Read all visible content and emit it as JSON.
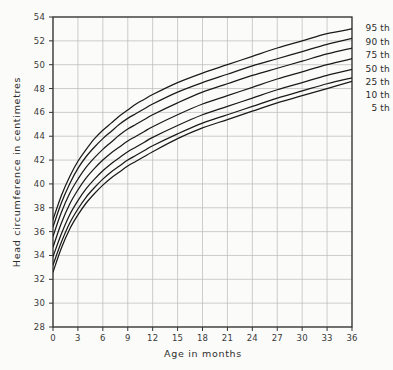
{
  "chart_data": {
    "type": "line",
    "title": "",
    "xlabel": "Age in months",
    "ylabel": "Head circumference in centimetres",
    "xlim": [
      0,
      36
    ],
    "ylim": [
      28,
      54
    ],
    "xticks": [
      0,
      3,
      6,
      9,
      12,
      15,
      18,
      21,
      24,
      27,
      30,
      33,
      36
    ],
    "yticks": [
      28,
      30,
      32,
      34,
      36,
      38,
      40,
      42,
      44,
      46,
      48,
      50,
      52,
      54
    ],
    "xtick_labels": [
      "0",
      "3",
      "6",
      "9",
      "12",
      "15",
      "18",
      "21",
      "24",
      "27",
      "30",
      "33",
      "36"
    ],
    "ytick_labels": [
      "28",
      "30",
      "32",
      "34",
      "36",
      "38",
      "40",
      "42",
      "44",
      "46",
      "48",
      "50",
      "52",
      "54"
    ],
    "grid": true,
    "legend_position": "right-inline",
    "x": [
      0,
      1,
      2,
      3,
      4,
      5,
      6,
      7,
      8,
      9,
      10,
      11,
      12,
      15,
      18,
      21,
      24,
      27,
      30,
      33,
      36
    ],
    "series": [
      {
        "name": "95 th",
        "label": "95 th",
        "color": "#1a1a1a",
        "values": [
          37.0,
          39.0,
          40.6,
          41.9,
          42.9,
          43.8,
          44.5,
          45.1,
          45.7,
          46.2,
          46.7,
          47.1,
          47.5,
          48.5,
          49.3,
          50.0,
          50.7,
          51.4,
          52.0,
          52.6,
          53.0
        ]
      },
      {
        "name": "90 th",
        "label": "90 th",
        "color": "#1a1a1a",
        "values": [
          36.4,
          38.4,
          40.0,
          41.3,
          42.3,
          43.1,
          43.8,
          44.4,
          45.0,
          45.5,
          45.9,
          46.3,
          46.7,
          47.7,
          48.5,
          49.2,
          49.9,
          50.5,
          51.1,
          51.7,
          52.2
        ]
      },
      {
        "name": "75 th",
        "label": "75 th",
        "color": "#1a1a1a",
        "values": [
          35.6,
          37.6,
          39.2,
          40.4,
          41.4,
          42.2,
          42.9,
          43.5,
          44.1,
          44.6,
          45.0,
          45.4,
          45.8,
          46.8,
          47.7,
          48.4,
          49.1,
          49.7,
          50.3,
          50.9,
          51.4
        ]
      },
      {
        "name": "50 th",
        "label": "50 th",
        "color": "#1a1a1a",
        "values": [
          34.7,
          36.7,
          38.3,
          39.5,
          40.5,
          41.3,
          42.0,
          42.6,
          43.1,
          43.6,
          44.0,
          44.4,
          44.8,
          45.8,
          46.7,
          47.4,
          48.1,
          48.8,
          49.4,
          50.0,
          50.5
        ]
      },
      {
        "name": "25 th",
        "label": "25 th",
        "color": "#1a1a1a",
        "values": [
          33.9,
          35.8,
          37.4,
          38.6,
          39.6,
          40.4,
          41.1,
          41.7,
          42.2,
          42.7,
          43.1,
          43.5,
          43.9,
          44.9,
          45.8,
          46.5,
          47.2,
          47.9,
          48.5,
          49.1,
          49.6
        ]
      },
      {
        "name": "10 th",
        "label": "10 th",
        "color": "#1a1a1a",
        "values": [
          33.2,
          35.1,
          36.7,
          37.9,
          38.9,
          39.7,
          40.4,
          41.0,
          41.5,
          42.0,
          42.4,
          42.8,
          43.2,
          44.2,
          45.1,
          45.8,
          46.5,
          47.2,
          47.8,
          48.4,
          48.9
        ]
      },
      {
        "name": "5 th",
        "label": "5 th",
        "color": "#1a1a1a",
        "values": [
          32.6,
          34.6,
          36.2,
          37.4,
          38.4,
          39.2,
          39.9,
          40.5,
          41.0,
          41.5,
          41.9,
          42.3,
          42.7,
          43.8,
          44.7,
          45.4,
          46.1,
          46.8,
          47.4,
          48.0,
          48.6
        ]
      }
    ]
  },
  "axes": {
    "x_title": "Age in months",
    "y_title": "Head circumference in centimetres"
  },
  "legend": {
    "entries": [
      "95 th",
      "90 th",
      "75 th",
      "50 th",
      "25 th",
      "10 th",
      "5 th"
    ]
  },
  "style": {
    "frame_color": "#333333",
    "grid_color": "#b9b9b9",
    "curve_color": "#1a1a1a",
    "background": "#fbfbf9",
    "text_color": "#2e2e2e"
  }
}
